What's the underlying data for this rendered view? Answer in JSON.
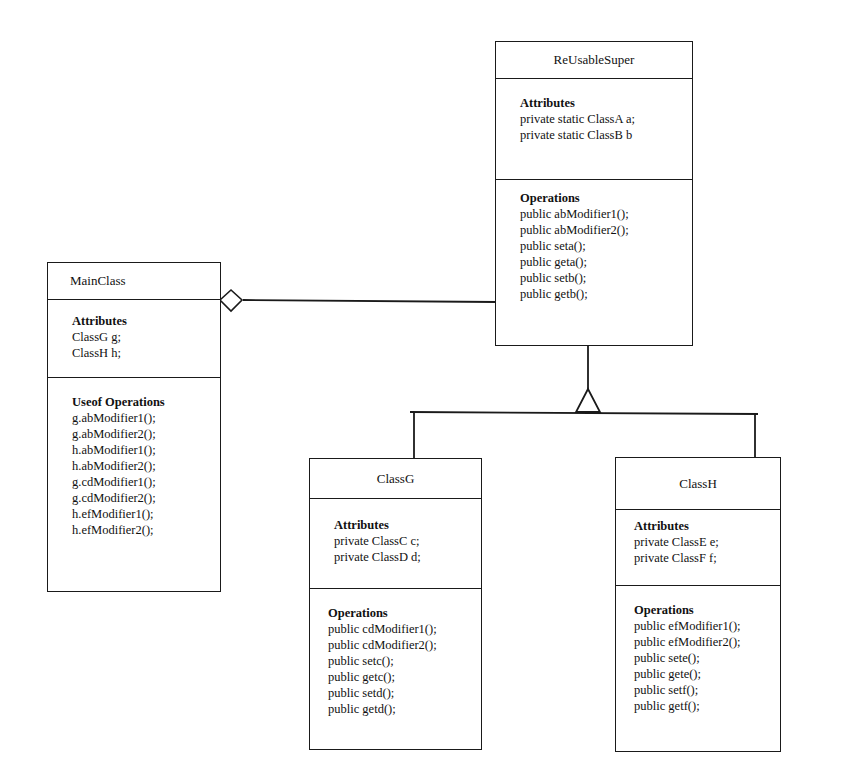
{
  "classes": {
    "reusable_super": {
      "name": "ReUsableSuper",
      "attributes_title": "Attributes",
      "attributes": [
        "private static ClassA a;",
        "private static ClassB b"
      ],
      "operations_title": "Operations",
      "operations": [
        "public abModifier1();",
        "public abModifier2();",
        "public seta();",
        "public geta();",
        "public setb();",
        "public getb();"
      ]
    },
    "main_class": {
      "name": "MainClass",
      "attributes_title": "Attributes",
      "attributes": [
        "ClassG g;",
        "ClassH h;"
      ],
      "operations_title": "Useof Operations",
      "operations": [
        "g.abModifier1();",
        "g.abModifier2();",
        "h.abModifier1();",
        "h.abModifier2();",
        "g.cdModifier1();",
        "g.cdModifier2();",
        "h.efModifier1();",
        "h.efModifier2();"
      ]
    },
    "class_g": {
      "name": "ClassG",
      "attributes_title": "Attributes",
      "attributes": [
        "private ClassC c;",
        "private ClassD d;"
      ],
      "operations_title": "Operations",
      "operations": [
        "public cdModifier1();",
        "public cdModifier2();",
        "public setc();",
        "public getc();",
        "public setd();",
        "public getd();"
      ]
    },
    "class_h": {
      "name": "ClassH",
      "attributes_title": "Attributes",
      "attributes": [
        "private ClassE e;",
        "private ClassF f;"
      ],
      "operations_title": "Operations",
      "operations": [
        "public efModifier1();",
        "public efModifier2();",
        "public sete();",
        "public gete();",
        "public setf();",
        "public getf();"
      ]
    }
  },
  "relationships": [
    {
      "type": "aggregation",
      "from": "MainClass",
      "to": "ReUsableSuper"
    },
    {
      "type": "generalization",
      "from": "ClassG",
      "to": "ReUsableSuper"
    },
    {
      "type": "generalization",
      "from": "ClassH",
      "to": "ReUsableSuper"
    }
  ]
}
